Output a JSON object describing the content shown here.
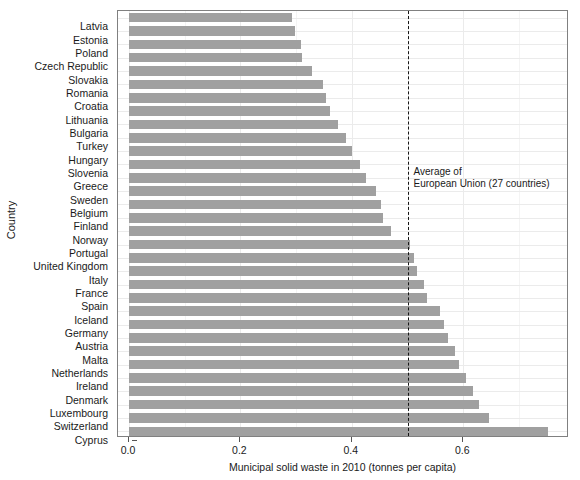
{
  "chart_data": {
    "type": "bar",
    "orientation": "horizontal",
    "title": "",
    "xlabel": "Municipal solid waste in 2010 (tonnes per capita)",
    "ylabel": "Country",
    "xlim": [
      0.0,
      0.8
    ],
    "x_ticks": [
      0.0,
      0.2,
      0.4,
      0.6
    ],
    "x_tick_labels": [
      "0.0",
      "0.2",
      "0.4",
      "0.6"
    ],
    "grid": true,
    "legend": null,
    "bar_color": "#a0a0a0",
    "categories": [
      "Latvia",
      "Estonia",
      "Poland",
      "Czech Republic",
      "Slovakia",
      "Romania",
      "Croatia",
      "Lithuania",
      "Bulgaria",
      "Turkey",
      "Hungary",
      "Slovenia",
      "Greece",
      "Sweden",
      "Belgium",
      "Finland",
      "Norway",
      "Portugal",
      "United Kingdom",
      "Italy",
      "France",
      "Spain",
      "Iceland",
      "Germany",
      "Austria",
      "Malta",
      "Netherlands",
      "Ireland",
      "Denmark",
      "Luxembourg",
      "Switzerland",
      "Cyprus"
    ],
    "values": [
      0.293,
      0.298,
      0.308,
      0.311,
      0.328,
      0.348,
      0.353,
      0.36,
      0.375,
      0.39,
      0.4,
      0.415,
      0.425,
      0.444,
      0.452,
      0.456,
      0.47,
      0.504,
      0.512,
      0.517,
      0.53,
      0.535,
      0.558,
      0.566,
      0.572,
      0.585,
      0.592,
      0.605,
      0.618,
      0.628,
      0.647,
      0.752
    ],
    "annotations": [
      {
        "name": "eu-average-reference-line",
        "type": "vertical-line",
        "value": 0.5,
        "style": "dashed",
        "color": "#141414",
        "label_line1": "Average of",
        "label_line2": "European Union (27 countries)"
      }
    ]
  }
}
